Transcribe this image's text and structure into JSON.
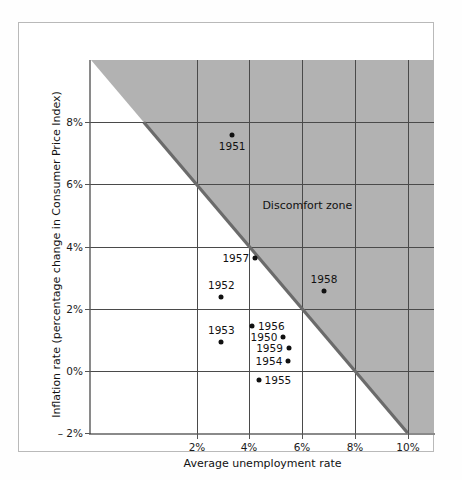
{
  "figure": {
    "background": "#ffffff",
    "frame_color": "#b9b9b9",
    "zone_label": "Discomfort zone",
    "zone_fill": "#b2b2b2",
    "diagonal_color": "#6b6b6b",
    "point_color": "#111111"
  },
  "chart_data": {
    "type": "scatter",
    "title": "",
    "xlabel": "Average unemployment rate",
    "ylabel": "Inflation rate (percentage change in Consumer Price Index)",
    "xlim": [
      -2,
      11
    ],
    "ylim": [
      -2,
      10
    ],
    "xticks": [
      2,
      4,
      6,
      8,
      10
    ],
    "xticklabels": [
      "2%",
      "4%",
      "6%",
      "8%",
      "10%"
    ],
    "yticks": [
      -2,
      0,
      2,
      4,
      6,
      8
    ],
    "yticklabels": [
      "– 2%",
      "0%",
      "2%",
      "4%",
      "6%",
      "8%"
    ],
    "grid": true,
    "legend": "none",
    "annotations": [
      {
        "text": "Discomfort zone",
        "x": 6.2,
        "y": 5.35
      }
    ],
    "shaded_region": {
      "label": "Discomfort zone",
      "description": "Region where unemployment rate plus inflation rate exceeds 8 percent",
      "boundary_line": {
        "from": [
          0,
          8
        ],
        "to": [
          10,
          -2
        ]
      },
      "fill": "#b2b2b2"
    },
    "points": [
      {
        "label": "1951",
        "x": 3.35,
        "y": 7.6,
        "label_pos": "below"
      },
      {
        "label": "1957",
        "x": 4.22,
        "y": 3.62,
        "label_pos": "left"
      },
      {
        "label": "1958",
        "x": 6.83,
        "y": 2.58,
        "label_pos": "above"
      },
      {
        "label": "1952",
        "x": 2.94,
        "y": 2.36,
        "label_pos": "above"
      },
      {
        "label": "1953",
        "x": 2.94,
        "y": 0.94,
        "label_pos": "above"
      },
      {
        "label": "1956",
        "x": 4.1,
        "y": 1.43,
        "label_pos": "right"
      },
      {
        "label": "1950",
        "x": 5.29,
        "y": 1.1,
        "label_pos": "left"
      },
      {
        "label": "1959",
        "x": 5.5,
        "y": 0.74,
        "label_pos": "left"
      },
      {
        "label": "1954",
        "x": 5.48,
        "y": 0.33,
        "label_pos": "left"
      },
      {
        "label": "1955",
        "x": 4.35,
        "y": -0.28,
        "label_pos": "right"
      }
    ]
  }
}
